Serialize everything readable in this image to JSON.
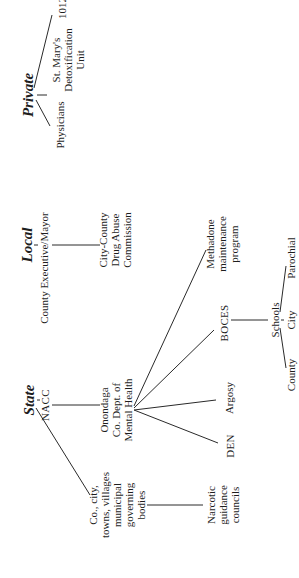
{
  "diagram": {
    "orientation": "rotated 90deg counter-clockwise",
    "sections": {
      "private": {
        "title": "Private",
        "children": [
          "Physicians",
          "St. Mary's Detoxification Unit",
          "1012"
        ]
      },
      "local": {
        "title": "Local",
        "head": "County Executive/Mayor",
        "children": [
          "City-County Drug Abuse Commission"
        ]
      },
      "state": {
        "title": "State",
        "head": "NACC",
        "children": [
          "Co., city, towns, villages municipal governing bodies",
          "Onondaga Co. Dept. of Mental Health"
        ]
      }
    },
    "nodes": {
      "private_title": "Private",
      "physicians": "Physicians",
      "st_marys": [
        "St. Mary's",
        "Detoxification",
        "Unit"
      ],
      "n1012": "1012",
      "local_title": "Local",
      "county_exec": "County Executive/Mayor",
      "city_county": [
        "City-County",
        "Drug Abuse",
        "Commission"
      ],
      "state_title": "State",
      "nacc": "NACC",
      "onondaga": [
        "Onondaga",
        "Co. Dept. of",
        "Mental Health"
      ],
      "municipal": [
        "Co., city,",
        "towns, villages",
        "municipal",
        "governing",
        "bodies"
      ],
      "narcotic": [
        "Narcotic",
        "guidance",
        "councils"
      ],
      "den": "DEN",
      "argosy": "Argosy",
      "boces": "BOCES",
      "methadone": [
        "Methadone",
        "maintenance",
        "program"
      ],
      "schools": "Schools",
      "county": "County",
      "city": "City",
      "parochial": "Parochial"
    },
    "edges": [
      [
        "Private",
        "Physicians"
      ],
      [
        "Private",
        "St. Mary's Detoxification Unit"
      ],
      [
        "Private",
        "1012"
      ],
      [
        "Local",
        "County Executive/Mayor"
      ],
      [
        "County Executive/Mayor",
        "City-County Drug Abuse Commission"
      ],
      [
        "State",
        "NACC"
      ],
      [
        "State",
        "Co., city, towns, villages municipal governing bodies"
      ],
      [
        "NACC",
        "Onondaga Co. Dept. of Mental Health"
      ],
      [
        "Co., city, towns, villages municipal governing bodies",
        "Narcotic guidance councils"
      ],
      [
        "Onondaga Co. Dept. of Mental Health",
        "DEN"
      ],
      [
        "Onondaga Co. Dept. of Mental Health",
        "Argosy"
      ],
      [
        "Onondaga Co. Dept. of Mental Health",
        "BOCES"
      ],
      [
        "Onondaga Co. Dept. of Mental Health",
        "Methadone maintenance program"
      ],
      [
        "BOCES",
        "Schools"
      ],
      [
        "Schools",
        "County"
      ],
      [
        "Schools",
        "City"
      ],
      [
        "Schools",
        "Parochial"
      ]
    ]
  }
}
